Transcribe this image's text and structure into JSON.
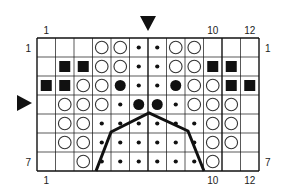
{
  "grid": {
    "cols": 12,
    "rows": 7,
    "x0": 37,
    "y0": 38,
    "cell_w": 18.5,
    "cell_h": 19,
    "thick_col_lines": [
      6,
      10
    ],
    "line_color": "#111111"
  },
  "symbols": {
    "E": "empty",
    "O": "open-circle",
    "d": "small-dot",
    "B": "large-filled-circle",
    "S": "filled-square"
  },
  "cells": [
    [
      "E",
      "E",
      "E",
      "O",
      "O",
      "d",
      "d",
      "O",
      "O",
      "E",
      "E",
      "E"
    ],
    [
      "E",
      "S",
      "S",
      "O",
      "O",
      "d",
      "d",
      "O",
      "O",
      "S",
      "S",
      "E"
    ],
    [
      "S",
      "S",
      "O",
      "O",
      "B",
      "d",
      "d",
      "B",
      "O",
      "O",
      "S",
      "S"
    ],
    [
      "E",
      "O",
      "O",
      "O",
      "d",
      "B",
      "B",
      "d",
      "O",
      "O",
      "O",
      "E"
    ],
    [
      "E",
      "O",
      "O",
      "d",
      "d",
      "d",
      "d",
      "d",
      "d",
      "O",
      "O",
      "E"
    ],
    [
      "E",
      "O",
      "O",
      "d",
      "d",
      "d",
      "d",
      "d",
      "d",
      "O",
      "O",
      "E"
    ],
    [
      "E",
      "E",
      "O",
      "d",
      "d",
      "d",
      "d",
      "d",
      "d",
      "O",
      "E",
      "E"
    ]
  ],
  "labels": {
    "top_cols": [
      {
        "text": "1",
        "col": 1
      },
      {
        "text": "10",
        "col": 10
      },
      {
        "text": "12",
        "col": 12
      }
    ],
    "bottom_cols": [
      {
        "text": "1",
        "col": 1
      },
      {
        "text": "10",
        "col": 10
      },
      {
        "text": "12",
        "col": 12
      }
    ],
    "left_rows": [
      {
        "text": "1",
        "row": 1
      },
      {
        "text": "7",
        "row": 7
      }
    ],
    "right_rows": [
      {
        "text": "1",
        "row": 1
      },
      {
        "text": "7",
        "row": 7
      }
    ]
  },
  "markers": {
    "center_column_arrow": {
      "direction": "down",
      "x": 148,
      "y": 16
    },
    "center_row_arrow": {
      "direction": "right",
      "x": 17,
      "y": 103
    }
  },
  "outline_path": [
    [
      96,
      171
    ],
    [
      111,
      132
    ],
    [
      149,
      113
    ],
    [
      188,
      131
    ],
    [
      204,
      171
    ]
  ]
}
